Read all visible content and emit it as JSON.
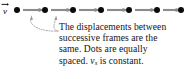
{
  "figure": {
    "background_color": "#ffffff"
  },
  "diagram": {
    "velocity_vector": {
      "label": "v",
      "has_overhead_arrow": true,
      "name": "velocity-vector-label"
    },
    "dot_color": "#0b0b0b",
    "arrow_color": "#8c8c8c",
    "dot_count": 7,
    "arrow_count": 6,
    "dot_positions_px": [
      17,
      45,
      73,
      101,
      129,
      157,
      181
    ],
    "dot_diameter_px": 6,
    "baseline_y_px": 10,
    "arrow_segments": [
      {
        "from_px": 23,
        "to_px": 44
      },
      {
        "from_px": 51,
        "to_px": 72
      },
      {
        "from_px": 79,
        "to_px": 100
      },
      {
        "from_px": 107,
        "to_px": 128
      },
      {
        "from_px": 135,
        "to_px": 156
      },
      {
        "from_px": 163,
        "to_px": 180
      }
    ]
  },
  "leaders": {
    "color": "#9a9a9a",
    "style": "dotted",
    "items": [
      {
        "name": "leader-to-first-gap",
        "target_x_px": 32,
        "target_y_px": 16
      },
      {
        "name": "leader-to-second-gap",
        "target_x_px": 56,
        "target_y_px": 16
      }
    ]
  },
  "caption": {
    "lines": [
      "The displacements between",
      "successive frames are the",
      "same. Dots are equally"
    ],
    "last_line": {
      "before_symbol": "spaced. ",
      "symbol": "v",
      "subscript": "s",
      "after_symbol": " is constant."
    },
    "full_text": "The displacements between successive frames are the same. Dots are equally spaced. v_s is constant.",
    "text_color": "#141414"
  }
}
